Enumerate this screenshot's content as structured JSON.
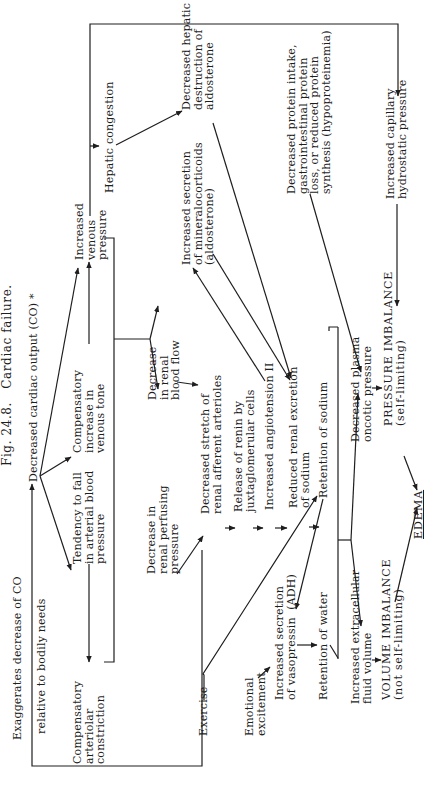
{
  "figure": {
    "title": "Fig. 24.8.   Cardiac failure.",
    "nodes": {
      "decreased_co": "Decreased cardiac output (CO) *",
      "exaggerates": "Exaggerates decrease of CO",
      "relative_needs": "relative to bodily needs",
      "comp_venous_tone": "Compensatory\nincrease in\nvenous tone",
      "inc_venous_pressure": "Increased\nvenous\npressure",
      "tendency_fall": "Tendency to fall\nin arterial blood\npressure",
      "comp_arteriolar": "Compensatory\narteriolar\nconstriction",
      "hepatic_congestion": "Hepatic congestion",
      "dec_renal_blood_flow": "Decrease\nin renal\nblood flow",
      "dec_renal_perfusing": "Decrease in\nrenal perfusing\npressure",
      "dec_hepatic_destruction": "Decreased hepatic\ndestruction of\naldosterone",
      "inc_mineralocorticoids": "Increased secretion\nof mineralocorticoids\n(aldosterone)",
      "dec_stretch": "Decreased stretch of\nrenal afferent arterioles",
      "release_renin": "Release of renin by\njuxtaglomerular cells",
      "inc_angiotensin": "Increased angiotension II",
      "reduced_excretion": "Reduced renal excretion\nof sodium",
      "retention_sodium": "Retention of sodium",
      "emotional_excitement": "Emotional\nexcitement",
      "inc_vasopressin": "Increased secretion\nof vasopressin  (ADH)",
      "retention_water": "Retention of water",
      "exercise": "Exercise",
      "dec_protein_intake": "Decreased protein intake,\ngastrointestinal protein\nloss, or reduced protein\nsynthesis (hypoproteinemia)",
      "inc_ecf_volume": "Increased extracellular\nfluid volume",
      "volume_imbalance": "VOLUME IMBALANCE\n(not self-limiting)",
      "dec_plasma_oncotic": "Decreased plasma\noncotic pressure",
      "pressure_imbalance": "PRESSURE IMBALANCE\n(self-limiting)",
      "edema": "EDEMA",
      "inc_capillary_pressure": "Increased capillary\nhydrostatic pressure"
    },
    "colors": {
      "ink": "#1e1e1e",
      "background": "#ffffff"
    }
  }
}
